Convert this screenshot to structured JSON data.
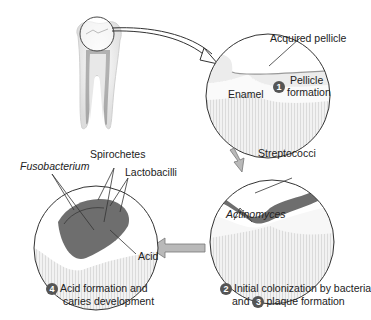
{
  "diagram": {
    "stage1": {
      "number": "1",
      "title_line1": "Pellicle",
      "title_line2": "formation",
      "labels": {
        "acquired_pellicle": "Acquired pellicle",
        "enamel": "Enamel"
      }
    },
    "stage23": {
      "number2": "2",
      "number3": "3",
      "line1": "Initial colonization by bacteria",
      "line2_pre": "and",
      "line2_post": "plaque formation",
      "labels": {
        "streptococci": "Streptococci",
        "actinomyces": "Actinomyces"
      }
    },
    "stage4": {
      "number": "4",
      "line1": "Acid formation and",
      "line2": "caries development",
      "labels": {
        "fusobacterium": "Fusobacterium",
        "spirochetes": "Spirochetes",
        "lactobacilli": "Lactobacilli",
        "acid": "Acid"
      }
    },
    "colors": {
      "badge": "#555555",
      "arrow_fill": "#b9b9b9",
      "plaque": "#6e6e6e",
      "enamel": "#f3f3f3"
    }
  }
}
